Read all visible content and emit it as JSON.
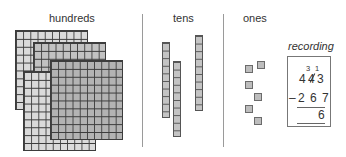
{
  "headings": {
    "hundreds": "hundreds",
    "tens": "tens",
    "ones": "ones"
  },
  "recording": {
    "title": "recording",
    "minuend_digits": [
      "4",
      "4",
      "3"
    ],
    "regroup_marks": {
      "tens_new": "3",
      "ones_carry": "1"
    },
    "operator": "–",
    "subtrahend": "2 6 7",
    "result": "6"
  },
  "blocks": {
    "hundreds_count": 4,
    "tens_count": 3,
    "ones_count": 6
  },
  "colors": {
    "light_block": "#dadada",
    "mid_block": "#c2c2c2",
    "dark_block": "#b3b3b3",
    "grid_line": "#3c3c3c",
    "divider": "#9a9a9a"
  }
}
